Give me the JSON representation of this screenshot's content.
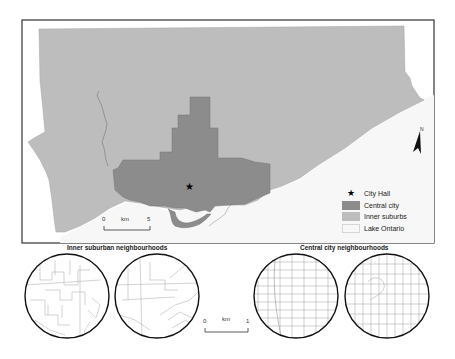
{
  "map": {
    "title": "Toronto: central city and inner suburbs",
    "colors": {
      "central_city": "#8c8c8c",
      "inner_suburbs": "#bdbdbd",
      "lake": "#f7f7f7",
      "frame": "#333333",
      "streets": "#b5b5b5"
    },
    "north_arrow": {
      "label": "N"
    },
    "scale_bar": {
      "start": "0",
      "unit": "km",
      "end": "5"
    },
    "legend": {
      "items": [
        {
          "symbol": "star",
          "label": "City Hall"
        },
        {
          "symbol": "swatch",
          "color": "#8c8c8c",
          "label": "Central city"
        },
        {
          "symbol": "swatch",
          "color": "#bdbdbd",
          "label": "Inner suburbs"
        },
        {
          "symbol": "swatch",
          "color": "#f7f7f7",
          "label": "Lake Ontario"
        }
      ]
    }
  },
  "insets": {
    "inner_suburban": {
      "title": "Inner suburban neighbourhoods",
      "count": 2
    },
    "central_city": {
      "title": "Central city neighbourhoods",
      "count": 2
    },
    "scale_bar": {
      "start": "0",
      "unit": "km",
      "end": "1"
    }
  }
}
